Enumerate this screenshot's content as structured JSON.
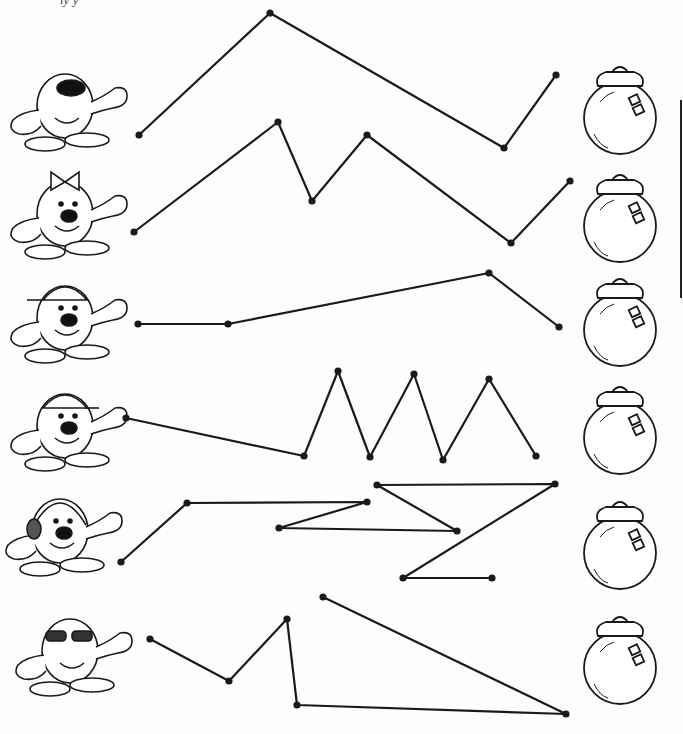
{
  "worksheet": {
    "header_fragment": "ly y",
    "activity": "trace-path-matching",
    "ink_color": "#1a1a1a",
    "paper_color": "#fdfdfd"
  },
  "rows": [
    {
      "character": "character-with-mask-and-gloves",
      "target": "jar-1",
      "path": [
        [
          139,
          135
        ],
        [
          270,
          13
        ],
        [
          504,
          148
        ],
        [
          556,
          75
        ]
      ]
    },
    {
      "character": "character-with-bow",
      "target": "jar-2",
      "path": [
        [
          134,
          232
        ],
        [
          278,
          122
        ],
        [
          312,
          201
        ],
        [
          367,
          135
        ],
        [
          511,
          243
        ],
        [
          570,
          181
        ]
      ]
    },
    {
      "character": "character-with-cap",
      "target": "jar-3",
      "path": [
        [
          138,
          324
        ],
        [
          228,
          324
        ],
        [
          489,
          273
        ],
        [
          559,
          327
        ]
      ]
    },
    {
      "character": "character-with-backwards-cap",
      "target": "jar-4",
      "path": [
        [
          126,
          418
        ],
        [
          304,
          456
        ],
        [
          338,
          371
        ],
        [
          370,
          457
        ],
        [
          414,
          374
        ],
        [
          443,
          460
        ],
        [
          489,
          379
        ],
        [
          536,
          456
        ]
      ]
    },
    {
      "character": "character-with-headphones",
      "target": "jar-5",
      "path": [
        [
          121,
          562
        ],
        [
          187,
          503
        ],
        [
          367,
          502
        ],
        [
          279,
          528
        ],
        [
          457,
          531
        ],
        [
          377,
          485
        ],
        [
          555,
          484
        ],
        [
          403,
          578
        ],
        [
          492,
          578
        ]
      ]
    },
    {
      "character": "character-with-sunglasses",
      "target": "jar-6",
      "path": [
        [
          150,
          639
        ],
        [
          229,
          681
        ],
        [
          287,
          619
        ],
        [
          297,
          705
        ],
        [
          566,
          714
        ],
        [
          323,
          597
        ]
      ]
    }
  ],
  "jars": [
    {
      "id": "jar-1",
      "cx": 620,
      "cy": 110
    },
    {
      "id": "jar-2",
      "cx": 620,
      "cy": 218
    },
    {
      "id": "jar-3",
      "cx": 620,
      "cy": 322
    },
    {
      "id": "jar-4",
      "cx": 620,
      "cy": 430
    },
    {
      "id": "jar-5",
      "cx": 620,
      "cy": 545
    },
    {
      "id": "jar-6",
      "cx": 620,
      "cy": 660
    }
  ],
  "characters": [
    {
      "id": "character-1",
      "cx": 65,
      "cy": 110
    },
    {
      "id": "character-2",
      "cx": 65,
      "cy": 218
    },
    {
      "id": "character-3",
      "cx": 65,
      "cy": 322
    },
    {
      "id": "character-4",
      "cx": 65,
      "cy": 430
    },
    {
      "id": "character-5",
      "cx": 60,
      "cy": 535
    },
    {
      "id": "character-6",
      "cx": 70,
      "cy": 655
    }
  ]
}
